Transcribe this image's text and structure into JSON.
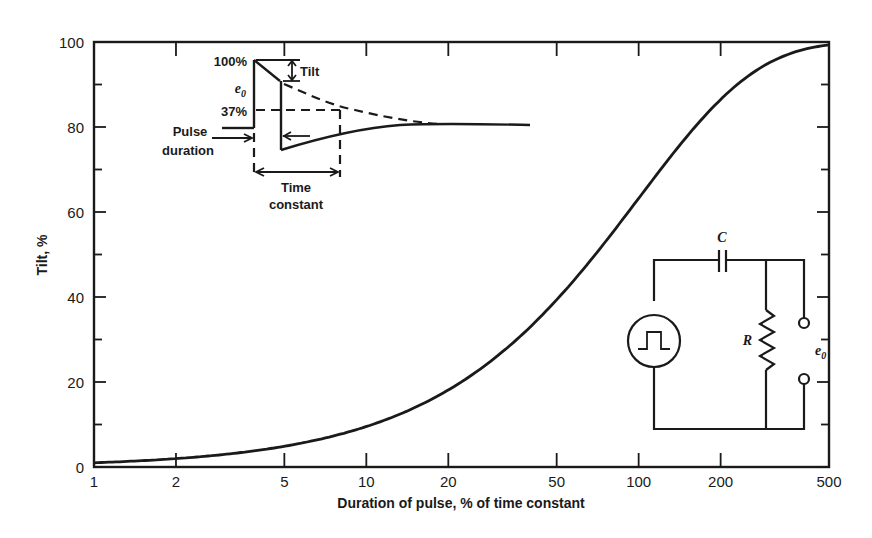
{
  "chart_data": {
    "type": "line",
    "title": "",
    "xlabel": "Duration of pulse, % of time constant",
    "ylabel": "Tilt, %",
    "xscale": "log",
    "xlim": [
      1,
      500
    ],
    "ylim": [
      0,
      100
    ],
    "x_ticks": [
      1,
      2,
      5,
      10,
      20,
      50,
      100,
      200,
      500
    ],
    "x_tick_labels": [
      "1",
      "2",
      "5",
      "10",
      "20",
      "50",
      "100",
      "200",
      "500"
    ],
    "y_ticks": [
      0,
      20,
      40,
      60,
      80,
      100
    ],
    "y_tick_labels": [
      "0",
      "20",
      "40",
      "60",
      "80",
      "100"
    ],
    "y_minor_ticks": [
      10,
      30,
      50,
      70,
      90
    ],
    "grid": false,
    "legend": null,
    "series": [
      {
        "name": "Tilt vs pulse duration",
        "x": [
          1,
          2,
          5,
          10,
          20,
          50,
          100,
          200,
          500
        ],
        "y": [
          1,
          2,
          4.9,
          9.5,
          18,
          39,
          63,
          86,
          99
        ]
      }
    ],
    "annotations": {
      "pulse_inset": {
        "labels": [
          "100%",
          "e0",
          "37%",
          "Tilt",
          "Pulse duration",
          "Time constant"
        ]
      },
      "circuit_inset": {
        "labels": [
          "C",
          "R",
          "e0"
        ],
        "components": [
          "pulse-source",
          "capacitor",
          "resistor",
          "output-terminals"
        ]
      }
    }
  },
  "labels": {
    "xlabel": "Duration of pulse, % of time constant",
    "ylabel": "Tilt, %",
    "x_ticks": [
      "1",
      "2",
      "5",
      "10",
      "20",
      "50",
      "100",
      "200",
      "500"
    ],
    "y_ticks": [
      "0",
      "20",
      "40",
      "60",
      "80",
      "100"
    ],
    "inset": {
      "pct100": "100%",
      "e0": "e",
      "e0_sub": "0",
      "pct37": "37%",
      "tilt": "Tilt",
      "pulse_1": "Pulse",
      "pulse_2": "duration",
      "time_1": "Time",
      "time_2": "constant"
    },
    "circuit": {
      "c": "C",
      "r": "R",
      "e0": "e",
      "e0_sub": "0"
    }
  },
  "colors": {
    "ink": "#1a1a1a",
    "background": "#ffffff"
  }
}
